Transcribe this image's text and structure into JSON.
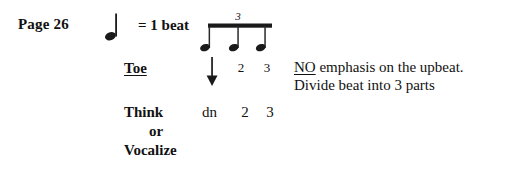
{
  "page": {
    "background": "#ffffff",
    "ink": "#111111",
    "width": 517,
    "height": 178
  },
  "header": {
    "page_label": "Page 26",
    "beat_equation": "= 1 beat"
  },
  "notation": {
    "quarter_note": {
      "icon": "quarter-note-icon",
      "meaning": "1 beat"
    },
    "triplet": {
      "icon": "eighth-note-triplet-beamed-icon",
      "tuplet_number": "3",
      "note_count": 3,
      "beamed": true
    },
    "accent_arrow": {
      "icon": "down-arrow-icon",
      "on_note": 1
    },
    "note_numbers": [
      "2",
      "3"
    ]
  },
  "rows": {
    "toe": {
      "label": "Toe",
      "underlined": true
    },
    "think_or_vocalize": {
      "line1": "Think",
      "line2": "or",
      "line3": "Vocalize"
    },
    "syllables": [
      "dn",
      "2",
      "3"
    ]
  },
  "notes": {
    "line1_emphasis": "NO",
    "line1_rest": " emphasis on the upbeat.",
    "line2": "Divide beat into 3 parts"
  }
}
